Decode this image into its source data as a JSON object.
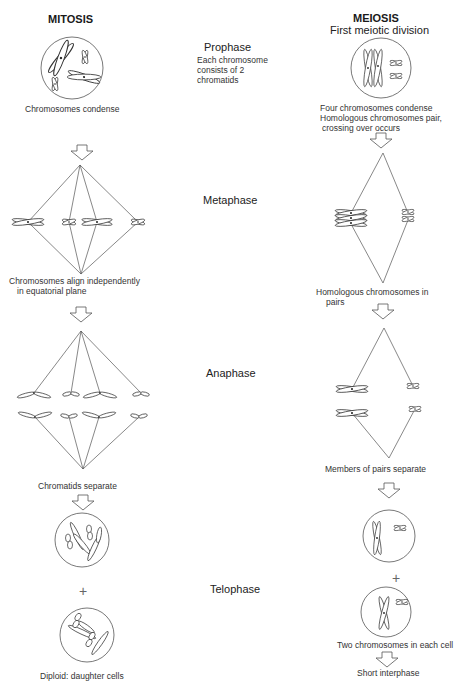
{
  "columns": {
    "mitosis": {
      "title": "MITOSIS",
      "labels": {
        "prophase": "Chromosomes condense",
        "metaphase_1": "Chromosomes align independently",
        "metaphase_2": "in equatorial plane",
        "anaphase": "Chromatids separate",
        "telophase": "Diploid: daughter cells"
      }
    },
    "meiosis": {
      "title": "MEIOSIS",
      "subtitle": "First meiotic division",
      "labels": {
        "prophase_1": "Four chromosomes condense",
        "prophase_2": "Homologous chromosomes pair,",
        "prophase_3": "crossing over occurs",
        "metaphase_1": "Homologous chromosomes in",
        "metaphase_2": "pairs",
        "anaphase": "Members of pairs separate",
        "telophase": "Two chromosomes in each cell",
        "interphase": "Short interphase"
      }
    }
  },
  "phases": {
    "prophase": "Prophase",
    "prophase_note_1": "Each chromosome",
    "prophase_note_2": "consists of 2",
    "prophase_note_3": "chromatids",
    "metaphase": "Metaphase",
    "anaphase": "Anaphase",
    "telophase": "Telophase"
  },
  "symbols": {
    "plus": "+"
  }
}
